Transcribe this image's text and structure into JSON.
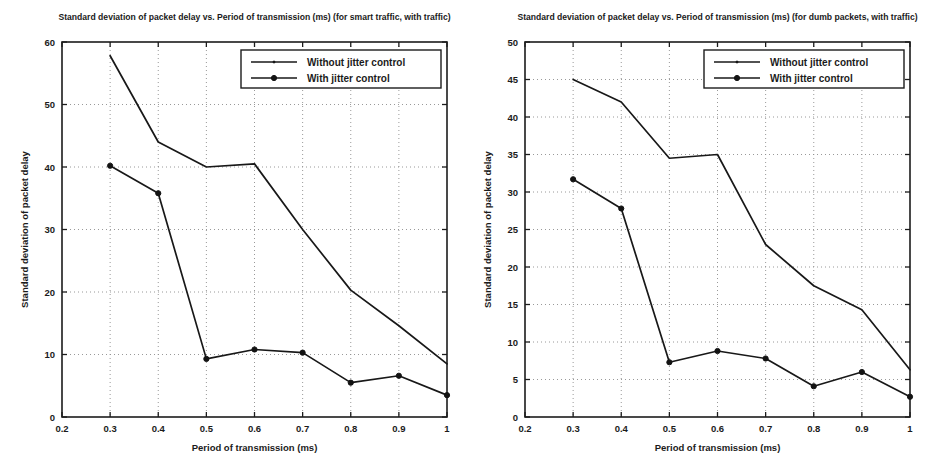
{
  "figure": {
    "background_color": "#ffffff",
    "line_color": "#181818",
    "grid_color": "#8d8d8d",
    "panel_count": 2
  },
  "chart_data": [
    {
      "type": "line",
      "panel": "left",
      "title": "Standard deviation of packet delay vs. Period of transmission (ms) (for smart traffic, with traffic)",
      "xlabel": "Period of transmission (ms)",
      "ylabel": "Standard deviation of packet delay",
      "xlim": [
        0.2,
        1.0
      ],
      "ylim": [
        0,
        60
      ],
      "xticks": [
        0.2,
        0.3,
        0.4,
        0.5,
        0.6,
        0.7,
        0.8,
        0.9,
        1.0
      ],
      "xticklabels": [
        "0.2",
        "0.3",
        "0.4",
        "0.5",
        "0.6",
        "0.7",
        "0.8",
        "0.9",
        "1"
      ],
      "yticks": [
        0,
        10,
        20,
        30,
        40,
        50,
        60
      ],
      "yticklabels": [
        "0",
        "10",
        "20",
        "30",
        "40",
        "50",
        "60"
      ],
      "grid": true,
      "legend_position": "top-right",
      "x": [
        0.3,
        0.4,
        0.5,
        0.6,
        0.7,
        0.8,
        0.9,
        1.0
      ],
      "series": [
        {
          "name": "Without jitter control",
          "marker": "none",
          "values": [
            57.8,
            44.0,
            40.0,
            40.5,
            30.0,
            20.3,
            14.6,
            8.5
          ]
        },
        {
          "name": "With jitter control",
          "marker": "dot",
          "values": [
            40.2,
            35.8,
            9.3,
            10.8,
            10.3,
            5.5,
            6.6,
            3.5
          ]
        }
      ]
    },
    {
      "type": "line",
      "panel": "right",
      "title": "Standard deviation of packet delay vs. Period of transmission (ms) (for dumb packets, with traffic)",
      "xlabel": "Period of transmission (ms)",
      "ylabel": "Standard deviation of packet delay",
      "xlim": [
        0.2,
        1.0
      ],
      "ylim": [
        0,
        50
      ],
      "xticks": [
        0.2,
        0.3,
        0.4,
        0.5,
        0.6,
        0.7,
        0.8,
        0.9,
        1.0
      ],
      "xticklabels": [
        "0.2",
        "0.3",
        "0.4",
        "0.5",
        "0.6",
        "0.7",
        "0.8",
        "0.9",
        "1"
      ],
      "yticks": [
        0,
        5,
        10,
        15,
        20,
        25,
        30,
        35,
        40,
        45,
        50
      ],
      "yticklabels": [
        "0",
        "5",
        "10",
        "15",
        "20",
        "25",
        "30",
        "35",
        "40",
        "45",
        "50"
      ],
      "grid": true,
      "legend_position": "top-right",
      "x": [
        0.3,
        0.4,
        0.5,
        0.6,
        0.7,
        0.8,
        0.9,
        1.0
      ],
      "series": [
        {
          "name": "Without jitter control",
          "marker": "none",
          "values": [
            45.0,
            42.0,
            34.5,
            35.0,
            23.0,
            17.5,
            14.3,
            6.3
          ]
        },
        {
          "name": "With jitter control",
          "marker": "dot",
          "values": [
            31.7,
            27.8,
            7.3,
            8.8,
            7.8,
            4.1,
            6.0,
            2.7
          ]
        }
      ]
    }
  ]
}
